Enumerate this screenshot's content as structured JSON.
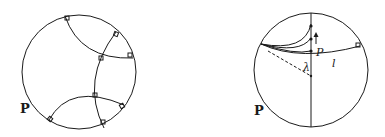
{
  "figures": [
    {
      "id": "left",
      "label": "P",
      "description": "Poincaré disk with geodesic arcs meeting at right angles"
    },
    {
      "id": "right",
      "label": "P",
      "point_label": "P",
      "line_label": "l",
      "angle_label": "λ",
      "description": "Poincaré disk showing geodesics from a boundary point through P and the angle of parallelism λ to line l"
    }
  ],
  "colors": {
    "ink": "#1a1a1a",
    "background": "#ffffff"
  }
}
